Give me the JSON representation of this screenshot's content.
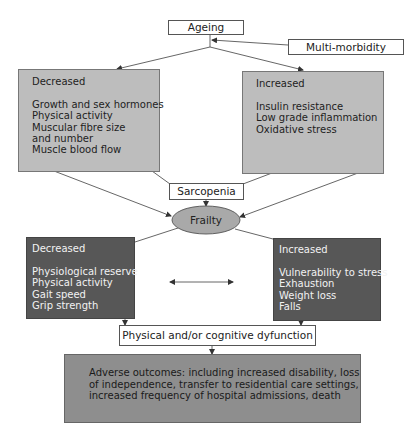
{
  "nodes": {
    "ageing": {
      "label": "Ageing"
    },
    "multimorbidity": {
      "label": "Multi-morbidity"
    },
    "decreased_upper": {
      "heading": "Decreased",
      "items": [
        "Growth and sex hormones",
        "Physical activity",
        "Muscular fibre size",
        "and number",
        "Muscle blood flow"
      ]
    },
    "increased_upper": {
      "heading": "Increased",
      "items": [
        "Insulin resistance",
        "Low grade inflammation",
        "Oxidative stress"
      ]
    },
    "sarcopenia": {
      "label": "Sarcopenia"
    },
    "frailty": {
      "label": "Frailty"
    },
    "decreased_lower": {
      "heading": "Decreased",
      "items": [
        "Physiological reserve",
        "Physical activity",
        "Gait speed",
        "Grip strength"
      ]
    },
    "increased_lower": {
      "heading": "Increased",
      "items": [
        "Vulnerability to stress",
        "Exhaustion",
        "Weight loss",
        "Falls"
      ]
    },
    "dysfunction": {
      "label": "Physical and/or cognitive dyfunction"
    },
    "outcomes": {
      "lines": [
        "Adverse outcomes: including increased disability, loss",
        "of independence, transfer to residential care settings,",
        "increased frequency of hospital admissions, death"
      ]
    }
  },
  "colors": {
    "light_fill": "#bdbdbd",
    "dark_fill": "#575757",
    "mid_fill": "#8e8e8e",
    "ellipse_fill": "#a9a9a9",
    "line": "#555555"
  }
}
